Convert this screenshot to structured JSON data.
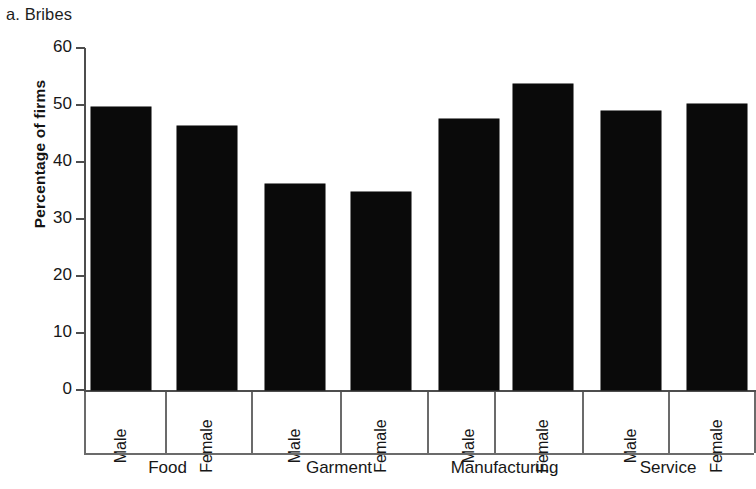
{
  "panel": {
    "title": "a. Bribes"
  },
  "chart_data": {
    "type": "bar",
    "title": "a. Bribes",
    "xlabel": "",
    "ylabel": "Percentage of firms",
    "ylim": [
      0,
      60
    ],
    "yticks": [
      0,
      10,
      20,
      30,
      40,
      50,
      60
    ],
    "ytick_labels": [
      "0",
      "10",
      "20",
      "30",
      "40",
      "50",
      "60"
    ],
    "grid": false,
    "legend": false,
    "bar_color": "#0a0a0a",
    "axis_color": "#4d4d4d",
    "groups": [
      "Food",
      "Garment",
      "Manufacturing",
      "Service"
    ],
    "categories": [
      "Male",
      "Female",
      "Male",
      "Female",
      "Male",
      "Female",
      "Male",
      "Female"
    ],
    "values": [
      49.6,
      46.4,
      36.2,
      34.8,
      47.6,
      53.7,
      48.9,
      50.2
    ],
    "bars": [
      {
        "group": "Food",
        "category": "Male",
        "value": 49.6
      },
      {
        "group": "Food",
        "category": "Female",
        "value": 46.4
      },
      {
        "group": "Garment",
        "category": "Male",
        "value": 36.2
      },
      {
        "group": "Garment",
        "category": "Female",
        "value": 34.8
      },
      {
        "group": "Manufacturing",
        "category": "Male",
        "value": 47.6
      },
      {
        "group": "Manufacturing",
        "category": "Female",
        "value": 53.7
      },
      {
        "group": "Service",
        "category": "Male",
        "value": 48.9
      },
      {
        "group": "Service",
        "category": "Female",
        "value": 50.2
      }
    ]
  }
}
